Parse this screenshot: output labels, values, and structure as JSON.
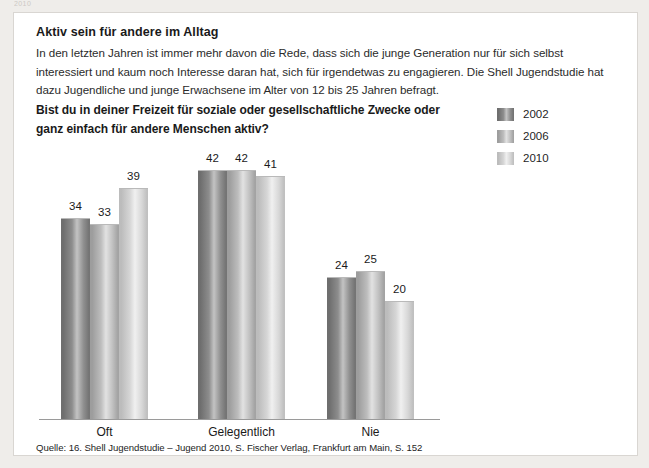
{
  "page": {
    "crumb": "2010",
    "background_color": "#efedea",
    "card_background": "#ffffff",
    "card_border_color": "#d9d6d2"
  },
  "article": {
    "heading": "Aktiv sein für andere im Alltag",
    "intro": "In den letzten Jahren ist immer mehr davon die Rede, dass sich die junge Generation nur für sich selbst interessiert und kaum noch Interesse daran hat, sich für irgendetwas zu engagieren. Die Shell Jugendstudie hat dazu Jugendliche und junge Erwachsene im Alter von 12 bis 25 Jahren befragt.",
    "question": "Bist du in deiner Freizeit für soziale oder gesellschaftliche Zwecke oder ganz einfach für andere Menschen aktiv?",
    "source": "Quelle: 16. Shell Jugendstudie – Jugend 2010, S. Fischer Verlag, Frankfurt am Main, S. 152"
  },
  "chart_data": {
    "type": "bar",
    "title": "Bist du in deiner Freizeit für soziale oder gesellschaftliche Zwecke oder ganz einfach für andere Menschen aktiv?",
    "xlabel": "",
    "ylabel": "",
    "ylim": [
      0,
      50
    ],
    "grid": false,
    "legend_position": "top-right",
    "categories": [
      "Oft",
      "Gelegentlich",
      "Nie"
    ],
    "series": [
      {
        "name": "2002",
        "values": [
          34,
          42,
          24
        ],
        "color": "#8c8c8c"
      },
      {
        "name": "2006",
        "values": [
          33,
          42,
          25
        ],
        "color": "#b5b5b5"
      },
      {
        "name": "2010",
        "values": [
          39,
          41,
          20
        ],
        "color": "#d2d2d2"
      }
    ],
    "axis_color": "#9a9a9a"
  }
}
